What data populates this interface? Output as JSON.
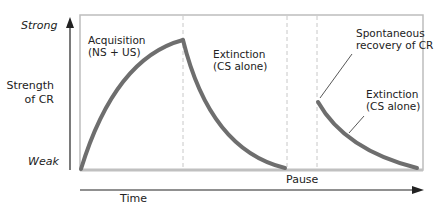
{
  "y_axis": {
    "top_label": "Strong",
    "bottom_label": "Weak",
    "title_line1": "Strength",
    "title_line2": "of CR"
  },
  "x_axis": {
    "title": "Time",
    "pause_label": "Pause"
  },
  "phases": {
    "acquisition_line1": "Acquisition",
    "acquisition_line2": "(NS + US)",
    "extinction1_line1": "Extinction",
    "extinction1_line2": "(CS alone)",
    "recovery_line1": "Spontaneous",
    "recovery_line2": "recovery of CR",
    "extinction2_line1": "Extinction",
    "extinction2_line2": "(CS alone)"
  },
  "colors": {
    "curve": "#6e6e6e",
    "frame": "#bdbdbd",
    "dashed": "#c8c8c8",
    "axis": "#222222"
  }
}
